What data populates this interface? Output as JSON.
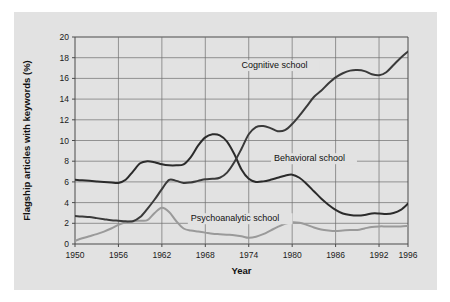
{
  "figure": {
    "background_color": "#e2e2e2",
    "page_background_color": "#ffffff"
  },
  "chart_data": {
    "type": "line",
    "title": "",
    "xlabel": "Year",
    "ylabel": "Flagship articles with keywords (%)",
    "xlim": [
      1950,
      1996
    ],
    "ylim": [
      0,
      20
    ],
    "ytick_step": 2,
    "grid": true,
    "legend_position": "inline-annotations",
    "xticks": [
      1950,
      1956,
      1962,
      1968,
      1974,
      1980,
      1986,
      1992,
      1996
    ],
    "xtick_labels": [
      "1950",
      "1956",
      "1962",
      "1968",
      "1974",
      "1980",
      "1986",
      "1992",
      "1996"
    ],
    "yticks": [
      0,
      2,
      4,
      6,
      8,
      10,
      12,
      14,
      16,
      18,
      20
    ],
    "ytick_labels": [
      "0",
      "2",
      "4",
      "6",
      "8",
      "10",
      "12",
      "14",
      "16",
      "18",
      "20"
    ],
    "gridlines_x": [
      1956,
      1962,
      1968,
      1974,
      1980,
      1986,
      1992
    ],
    "series": [
      {
        "name": "Cognitive school",
        "color": "#3a3a3a",
        "width": 2.0,
        "label_x": 1973.0,
        "label_y": 17.0,
        "x": [
          1950,
          1951,
          1952,
          1953,
          1954,
          1955,
          1956,
          1957,
          1958,
          1959,
          1960,
          1961,
          1962,
          1963,
          1964,
          1965,
          1966,
          1967,
          1968,
          1969,
          1970,
          1971,
          1972,
          1973,
          1974,
          1975,
          1976,
          1977,
          1978,
          1979,
          1980,
          1981,
          1982,
          1983,
          1984,
          1985,
          1986,
          1987,
          1988,
          1989,
          1990,
          1991,
          1992,
          1993,
          1994,
          1995,
          1996
        ],
        "values": [
          2.7,
          2.65,
          2.6,
          2.5,
          2.4,
          2.3,
          2.25,
          2.2,
          2.2,
          2.6,
          3.4,
          4.3,
          5.3,
          6.2,
          6.1,
          5.9,
          5.95,
          6.1,
          6.25,
          6.3,
          6.4,
          6.9,
          7.9,
          9.2,
          10.6,
          11.3,
          11.4,
          11.2,
          10.9,
          11.0,
          11.6,
          12.4,
          13.3,
          14.2,
          14.8,
          15.5,
          16.1,
          16.5,
          16.75,
          16.8,
          16.7,
          16.4,
          16.3,
          16.6,
          17.3,
          18.0,
          18.6
        ]
      },
      {
        "name": "Behavioral school",
        "color": "#2b2b2b",
        "width": 2.0,
        "label_x": 1977.5,
        "label_y": 8.0,
        "x": [
          1950,
          1951,
          1952,
          1953,
          1954,
          1955,
          1956,
          1957,
          1958,
          1959,
          1960,
          1961,
          1962,
          1963,
          1964,
          1965,
          1966,
          1967,
          1968,
          1969,
          1970,
          1971,
          1972,
          1973,
          1974,
          1975,
          1976,
          1977,
          1978,
          1979,
          1980,
          1981,
          1982,
          1983,
          1984,
          1985,
          1986,
          1987,
          1988,
          1989,
          1990,
          1991,
          1992,
          1993,
          1994,
          1995,
          1996
        ],
        "values": [
          6.2,
          6.15,
          6.1,
          6.05,
          6.0,
          5.95,
          5.9,
          6.2,
          7.0,
          7.8,
          8.0,
          7.9,
          7.7,
          7.6,
          7.6,
          7.7,
          8.4,
          9.5,
          10.3,
          10.6,
          10.5,
          9.9,
          8.7,
          7.2,
          6.3,
          6.0,
          6.05,
          6.2,
          6.4,
          6.6,
          6.7,
          6.4,
          5.8,
          5.1,
          4.4,
          3.8,
          3.3,
          2.95,
          2.8,
          2.75,
          2.8,
          2.95,
          2.95,
          2.9,
          3.0,
          3.3,
          3.9
        ]
      },
      {
        "name": "Psychoanalytic school",
        "color": "#9a9a9a",
        "width": 2.0,
        "label_x": 1966.0,
        "label_y": 2.2,
        "x": [
          1950,
          1951,
          1952,
          1953,
          1954,
          1955,
          1956,
          1957,
          1958,
          1959,
          1960,
          1961,
          1962,
          1963,
          1964,
          1965,
          1966,
          1967,
          1968,
          1969,
          1970,
          1971,
          1972,
          1973,
          1974,
          1975,
          1976,
          1977,
          1978,
          1979,
          1980,
          1981,
          1982,
          1983,
          1984,
          1985,
          1986,
          1987,
          1988,
          1989,
          1990,
          1991,
          1992,
          1993,
          1994,
          1995,
          1996
        ],
        "values": [
          0.3,
          0.55,
          0.75,
          0.95,
          1.2,
          1.5,
          1.85,
          2.1,
          2.2,
          2.25,
          2.3,
          3.0,
          3.5,
          3.1,
          2.2,
          1.5,
          1.3,
          1.2,
          1.1,
          1.0,
          0.95,
          0.9,
          0.85,
          0.75,
          0.6,
          0.7,
          0.95,
          1.3,
          1.65,
          1.95,
          2.1,
          2.05,
          1.85,
          1.6,
          1.4,
          1.3,
          1.25,
          1.3,
          1.35,
          1.35,
          1.5,
          1.65,
          1.7,
          1.7,
          1.7,
          1.7,
          1.75
        ]
      }
    ]
  }
}
